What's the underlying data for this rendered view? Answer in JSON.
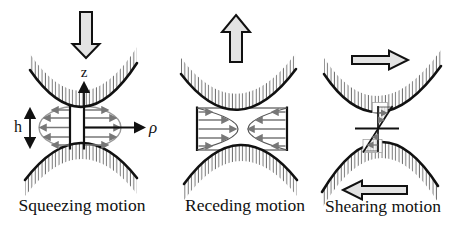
{
  "figure": {
    "colors": {
      "line": "#111111",
      "block_arrow_fill": "#e3e3e3",
      "flow_arrow": "#777777",
      "envelope": "#9a9a9a",
      "hatch": "#666666",
      "background": "#ffffff"
    },
    "panels": [
      {
        "id": "squeezing",
        "caption": "Squeezing motion",
        "block_arrow_direction": "down",
        "labels": {
          "z_axis": "z",
          "rho_axis": "ρ",
          "gap_height": "h"
        }
      },
      {
        "id": "receding",
        "caption": "Receding motion",
        "block_arrow_direction": "up"
      },
      {
        "id": "shearing",
        "caption": "Shearing motion",
        "block_arrow_directions": "right-top, left-bottom"
      }
    ]
  }
}
